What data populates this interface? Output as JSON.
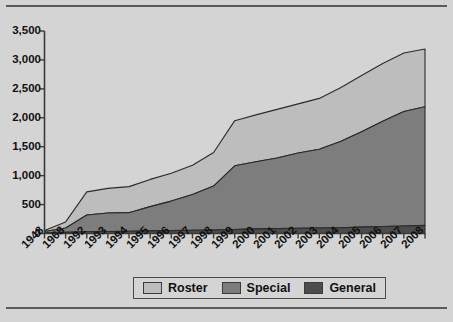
{
  "chart_data": {
    "type": "area",
    "stacked": true,
    "title": "",
    "xlabel": "",
    "ylabel": "",
    "grid": false,
    "legend_position": "bottom",
    "ylim": [
      0,
      3500
    ],
    "ytick_values": [
      0,
      500,
      1000,
      1500,
      2000,
      2500,
      3000,
      3500
    ],
    "ytick_labels": [
      "0",
      "500",
      "1,000",
      "1,500",
      "2,000",
      "2,500",
      "3,000",
      "3,500"
    ],
    "categories": [
      "1948",
      "1968",
      "1992",
      "1993",
      "1994",
      "1995",
      "1996",
      "1997",
      "1998",
      "1999",
      "2000",
      "2001",
      "2002",
      "2003",
      "2004",
      "2005",
      "2006",
      "2007",
      "2008"
    ],
    "series": [
      {
        "name": "General",
        "color": "#4c4c4c",
        "values": [
          10,
          20,
          30,
          35,
          40,
          45,
          50,
          55,
          60,
          70,
          80,
          85,
          90,
          95,
          100,
          110,
          120,
          130,
          140
        ]
      },
      {
        "name": "Special",
        "color": "#7d7d7d",
        "values": [
          25,
          75,
          290,
          320,
          320,
          420,
          510,
          620,
          760,
          1100,
          1160,
          1220,
          1300,
          1360,
          1490,
          1650,
          1820,
          1980,
          2050
        ]
      },
      {
        "name": "Roster",
        "color": "#bdbdbd",
        "values": [
          15,
          105,
          400,
          425,
          450,
          470,
          480,
          505,
          580,
          780,
          810,
          840,
          850,
          880,
          930,
          970,
          1000,
          1010,
          1000
        ]
      }
    ],
    "cumulative_totals": [
      50,
      200,
      720,
      780,
      810,
      935,
      1040,
      1180,
      1400,
      1950,
      2050,
      2145,
      2240,
      2335,
      2520,
      2730,
      2940,
      3120,
      3190
    ]
  },
  "legend": {
    "items": [
      {
        "label": "Roster",
        "color": "#bdbdbd"
      },
      {
        "label": "Special",
        "color": "#7d7d7d"
      },
      {
        "label": "General",
        "color": "#4c4c4c"
      }
    ]
  },
  "colors": {
    "background": "#d4d4d4",
    "axis": "#3a3a3a",
    "frame": "#5a5a5a"
  }
}
